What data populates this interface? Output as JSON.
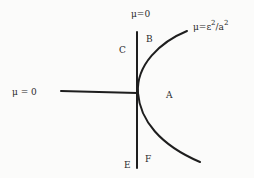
{
  "diagram": {
    "type": "phase-boundary-sketch",
    "labels": {
      "top_vertical": "μ=0",
      "left_horizontal": "μ = 0",
      "curve": {
        "base": "μ=ε",
        "exp1": "2",
        "mid": "/a",
        "exp2": "2"
      },
      "regions": {
        "A": "A",
        "B": "B",
        "C": "C",
        "E": "E",
        "F": "F"
      }
    },
    "elements": [
      {
        "id": "vertical-line",
        "label": "μ=0"
      },
      {
        "id": "horizontal-line",
        "label": "μ = 0"
      },
      {
        "id": "parabola-curve",
        "label": "μ=ε²/a²"
      }
    ]
  }
}
